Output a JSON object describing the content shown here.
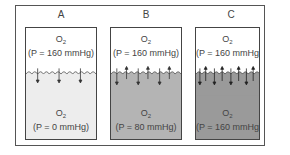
{
  "diagram": {
    "colors": {
      "frame": "#555555",
      "beaker_border": "#444444",
      "gas": "#ffffff",
      "liquid_A": "#ededed",
      "liquid_B": "#b4b4b4",
      "liquid_C": "#9a9a9a",
      "text": "#444444"
    },
    "panels": [
      {
        "label": "A",
        "gas": {
          "species": "O",
          "subscript": "2",
          "pressure": "(P = 160  mmHg)"
        },
        "liquid": {
          "species": "O",
          "subscript": "2",
          "pressure": "(P = 0  mmHg)"
        },
        "arrows": {
          "down": 3,
          "up": 0
        }
      },
      {
        "label": "B",
        "gas": {
          "species": "O",
          "subscript": "2",
          "pressure": "(P = 160  mmHg)"
        },
        "liquid": {
          "species": "O",
          "subscript": "2",
          "pressure": "(P = 80  mmHg)"
        },
        "arrows": {
          "down": 3,
          "up": 3
        }
      },
      {
        "label": "C",
        "gas": {
          "species": "O",
          "subscript": "2",
          "pressure": "(P = 160  mmHg)"
        },
        "liquid": {
          "species": "O",
          "subscript": "2",
          "pressure": "(P = 160  mmHg)"
        },
        "arrows": {
          "down": 4,
          "up": 4
        }
      }
    ]
  }
}
